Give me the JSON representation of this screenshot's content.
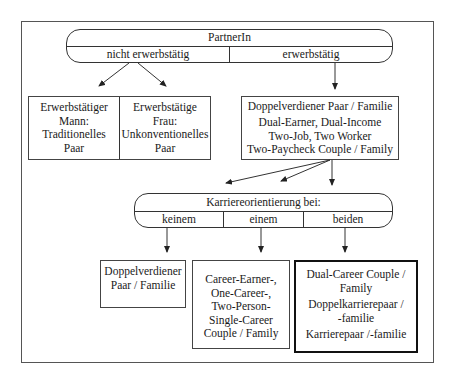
{
  "diagram": {
    "top": {
      "title": "PartnerIn",
      "left": "nicht erwerbstätig",
      "right": "erwerbstätig"
    },
    "left_box": {
      "col1": [
        "Erwerbstätiger",
        "Mann:",
        "Traditionelles",
        "Paar"
      ],
      "col2": [
        "Erwerbstätige",
        "Frau:",
        "Unkonventionelles",
        "Paar"
      ]
    },
    "right_box": {
      "lines": [
        "Doppelverdiener Paar / Familie",
        "Dual-Earner, Dual-Income",
        "Two-Job, Two Worker",
        "Two-Paycheck Couple / Family"
      ]
    },
    "middle": {
      "title": "Karriereorientierung bei:",
      "cols": [
        "keinem",
        "einem",
        "beiden"
      ]
    },
    "bottom": {
      "box1": [
        "Doppelverdiener",
        "Paar / Familie"
      ],
      "box2": [
        "Career-Earner-,",
        "One-Career-,",
        "Two-Person-",
        "Single-Career",
        "Couple / Family"
      ],
      "box3": [
        "Dual-Career Couple /",
        "Family",
        "Doppelkarrierepaar /",
        "-familie",
        "Karrierepaar /-familie"
      ]
    }
  }
}
